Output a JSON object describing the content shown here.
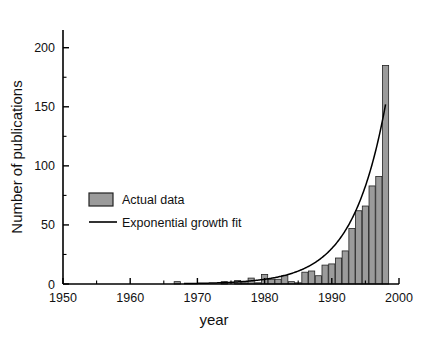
{
  "chart_data": {
    "type": "bar",
    "title": "",
    "xlabel": "year",
    "ylabel": "Number of publications",
    "xlim": [
      1950,
      2000
    ],
    "ylim": [
      0,
      215
    ],
    "grid": false,
    "legend_position": "center-left",
    "x_ticks": [
      1950,
      1960,
      1970,
      1980,
      1990,
      2000
    ],
    "x_tick_labels": [
      "1950",
      "1960",
      "1970",
      "1980",
      "1990",
      "2000"
    ],
    "x_minor_tick_step": 5,
    "y_ticks": [
      0,
      50,
      100,
      150,
      200
    ],
    "y_tick_labels": [
      "0",
      "50",
      "100",
      "150",
      "200"
    ],
    "y_minor_tick_step": 25,
    "series": [
      {
        "name": "Actual data",
        "type": "bar",
        "color": "#9b9b9b",
        "edge_color": "#222222",
        "x": [
          1951,
          1952,
          1953,
          1954,
          1955,
          1956,
          1957,
          1958,
          1959,
          1960,
          1961,
          1962,
          1963,
          1964,
          1965,
          1966,
          1967,
          1968,
          1969,
          1970,
          1971,
          1972,
          1973,
          1974,
          1975,
          1976,
          1977,
          1978,
          1979,
          1980,
          1981,
          1982,
          1983,
          1984,
          1985,
          1986,
          1987,
          1988,
          1989,
          1990,
          1991,
          1992,
          1993,
          1994,
          1995,
          1996,
          1997,
          1998
        ],
        "values": [
          0,
          0,
          0,
          0,
          0,
          0,
          0,
          0,
          0,
          0,
          0,
          0,
          0,
          0,
          0,
          0,
          2,
          0,
          0,
          0,
          0,
          0,
          0,
          2,
          0,
          3,
          1,
          5,
          1,
          8,
          4,
          4,
          7,
          2,
          1,
          10,
          11,
          7,
          16,
          17,
          22,
          28,
          47,
          62,
          66,
          83,
          91,
          185
        ]
      },
      {
        "name": "Exponential growth fit",
        "type": "line",
        "color": "#000000",
        "x": [
          1968,
          1970,
          1972,
          1974,
          1976,
          1978,
          1980,
          1982,
          1984,
          1986,
          1988,
          1990,
          1992,
          1994,
          1996,
          1998
        ],
        "values": [
          0.35,
          0.5,
          0.8,
          1.2,
          1.8,
          2.7,
          4.0,
          6.0,
          9.0,
          13.4,
          20.0,
          30.0,
          45.0,
          67.0,
          100.0,
          152.0
        ]
      }
    ],
    "legend_entries": [
      {
        "label": "Actual data",
        "marker": "bar-swatch"
      },
      {
        "label": "Exponential growth fit",
        "marker": "line-swatch"
      }
    ]
  },
  "axes": {
    "x_title": "year",
    "y_title": "Number of publications"
  },
  "colors": {
    "bar_fill": "#9b9b9b",
    "bar_edge": "#222222",
    "line": "#000000",
    "axis": "#000000",
    "background": "#ffffff"
  }
}
